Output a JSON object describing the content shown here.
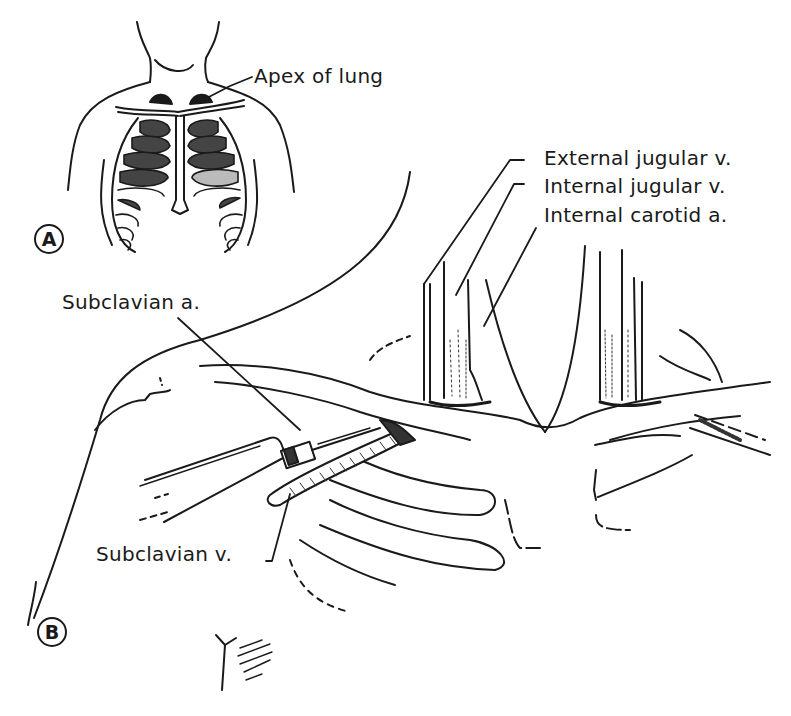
{
  "figure": {
    "panels": [
      {
        "id": "A",
        "badge": "A",
        "description": "Anterior view of thorax showing rib cage and lung apices"
      },
      {
        "id": "B",
        "badge": "B",
        "description": "Subclavian vein puncture with syringe below clavicle"
      }
    ],
    "labels": {
      "apex_of_lung": "Apex of lung",
      "external_jugular_v": "External jugular v.",
      "internal_jugular_v": "Internal jugular v.",
      "internal_carotid_a": "Internal carotid a.",
      "subclavian_a": "Subclavian a.",
      "subclavian_v": "Subclavian v."
    },
    "colors": {
      "ink": "#1a1a1a",
      "background": "#ffffff"
    }
  }
}
